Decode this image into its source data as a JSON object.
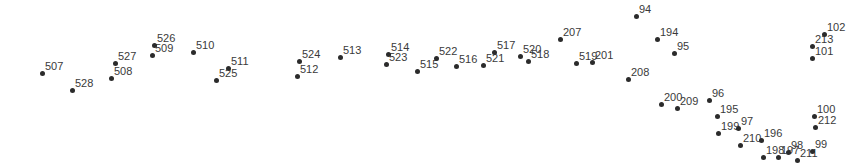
{
  "chart_data": {
    "type": "scatter",
    "title": "",
    "subtitle": "",
    "xlabel": "",
    "ylabel": "",
    "grid": false,
    "legend": "none",
    "axes_visible": false,
    "background_color": "#ffffff",
    "marker_color": "#2b2b2b",
    "label_color": "#3a3a3a",
    "marker_size_px": 5,
    "label_font_size_px": 11,
    "xlim": [
      0,
      860
    ],
    "ylim": [
      0,
      168
    ],
    "note": "Pixel coordinates; y measured downward from top-left of the 860x168 canvas.",
    "point_count": 42,
    "points": [
      {
        "label": "507",
        "x": 42,
        "y": 73
      },
      {
        "label": "528",
        "x": 72,
        "y": 90
      },
      {
        "label": "508",
        "x": 111,
        "y": 78
      },
      {
        "label": "527",
        "x": 115,
        "y": 63
      },
      {
        "label": "509",
        "x": 152,
        "y": 55
      },
      {
        "label": "526",
        "x": 154,
        "y": 45
      },
      {
        "label": "510",
        "x": 193,
        "y": 52
      },
      {
        "label": "525",
        "x": 216,
        "y": 80
      },
      {
        "label": "511",
        "x": 228,
        "y": 68
      },
      {
        "label": "512",
        "x": 297,
        "y": 76
      },
      {
        "label": "524",
        "x": 299,
        "y": 61
      },
      {
        "label": "513",
        "x": 340,
        "y": 57
      },
      {
        "label": "523",
        "x": 386,
        "y": 64
      },
      {
        "label": "514",
        "x": 388,
        "y": 54
      },
      {
        "label": "515",
        "x": 417,
        "y": 71
      },
      {
        "label": "522",
        "x": 436,
        "y": 58
      },
      {
        "label": "516",
        "x": 456,
        "y": 66
      },
      {
        "label": "521",
        "x": 483,
        "y": 65
      },
      {
        "label": "517",
        "x": 494,
        "y": 52
      },
      {
        "label": "520",
        "x": 520,
        "y": 56
      },
      {
        "label": "518",
        "x": 528,
        "y": 61
      },
      {
        "label": "207",
        "x": 560,
        "y": 39
      },
      {
        "label": "519",
        "x": 576,
        "y": 63
      },
      {
        "label": "201",
        "x": 592,
        "y": 62
      },
      {
        "label": "94",
        "x": 636,
        "y": 16
      },
      {
        "label": "208",
        "x": 628,
        "y": 79
      },
      {
        "label": "194",
        "x": 657,
        "y": 39
      },
      {
        "label": "95",
        "x": 674,
        "y": 53
      },
      {
        "label": "200",
        "x": 661,
        "y": 104
      },
      {
        "label": "209",
        "x": 677,
        "y": 108
      },
      {
        "label": "96",
        "x": 709,
        "y": 100
      },
      {
        "label": "195",
        "x": 717,
        "y": 116
      },
      {
        "label": "199",
        "x": 718,
        "y": 133
      },
      {
        "label": "97",
        "x": 738,
        "y": 128
      },
      {
        "label": "210",
        "x": 740,
        "y": 145
      },
      {
        "label": "196",
        "x": 761,
        "y": 140
      },
      {
        "label": "198",
        "x": 763,
        "y": 157
      },
      {
        "label": "197",
        "x": 778,
        "y": 157
      },
      {
        "label": "98",
        "x": 788,
        "y": 152
      },
      {
        "label": "211",
        "x": 797,
        "y": 160
      },
      {
        "label": "99",
        "x": 812,
        "y": 151
      },
      {
        "label": "100",
        "x": 814,
        "y": 116
      },
      {
        "label": "212",
        "x": 815,
        "y": 127
      },
      {
        "label": "101",
        "x": 812,
        "y": 58
      },
      {
        "label": "213",
        "x": 812,
        "y": 46
      },
      {
        "label": "102",
        "x": 824,
        "y": 34
      }
    ]
  }
}
